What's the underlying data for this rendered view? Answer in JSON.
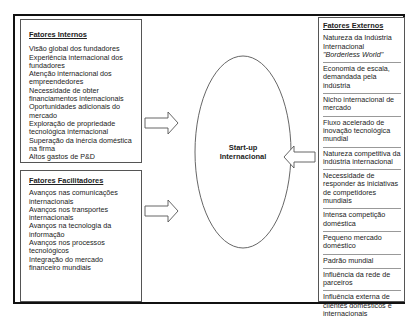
{
  "center": {
    "line1": "Start-up",
    "line2": "Internacional"
  },
  "internos": {
    "title": "Fatores Internos",
    "items": [
      "Visão global dos fundadores",
      "Experiência internacional dos fundadores",
      "Atenção internacional dos empreendedores",
      "Necessidade de obter financiamentos internacionais",
      "Oportunidades adicionais do mercado",
      "Exploração de propriedade tecnológica internacional",
      "Superação da inércia doméstica na firma",
      "Altos gastos de P&D"
    ]
  },
  "facilitadores": {
    "title": "Fatores Facilitadores",
    "items": [
      "Avanços nas comunicações internacionais",
      "Avanços nos transportes internacionais",
      "Avanços na tecnologia da informação",
      "Avanços nos processos tecnológicos",
      "Integração do mercado financeiro mundiais"
    ]
  },
  "externos": {
    "title": "Fatores Externos",
    "items": [
      {
        "text": "Natureza da Indústria Internacional",
        "italic": "\"Borderless World\""
      },
      {
        "text": "Economia de escala, demandada pela indústria"
      },
      {
        "text": "Nicho internacional de mercado"
      },
      {
        "text": "Fluxo acelerado de inovação tecnológica mundial"
      },
      {
        "text": "Natureza competitiva da indústria internacional"
      },
      {
        "text": "Necessidade de responder às iniciativas de competidores mundiais"
      },
      {
        "text": "Intensa competição doméstica"
      },
      {
        "text": "Pequeno mercado doméstico"
      },
      {
        "text": "Padrão mundial"
      },
      {
        "text": "Influência da rede de parceiros"
      },
      {
        "text": "Influência externa de clientes domésticos e internacionais"
      }
    ]
  }
}
